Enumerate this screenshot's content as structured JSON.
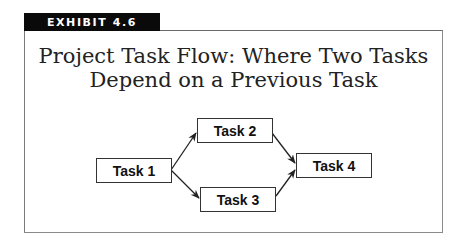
{
  "exhibit": {
    "label": "EXHIBIT 4.6"
  },
  "title": {
    "line1": "Project Task Flow: Where Two Tasks",
    "line2": "Depend on a Previous Task"
  },
  "diagram": {
    "nodes": [
      {
        "id": "task1",
        "label": "Task 1"
      },
      {
        "id": "task2",
        "label": "Task 2"
      },
      {
        "id": "task3",
        "label": "Task 3"
      },
      {
        "id": "task4",
        "label": "Task 4"
      }
    ],
    "edges": [
      {
        "from": "task1",
        "to": "task2"
      },
      {
        "from": "task1",
        "to": "task3"
      },
      {
        "from": "task2",
        "to": "task4"
      },
      {
        "from": "task3",
        "to": "task4"
      }
    ]
  },
  "colors": {
    "tag_bg": "#0a0a0a",
    "border": "#7a7a7a",
    "line": "#222222"
  }
}
